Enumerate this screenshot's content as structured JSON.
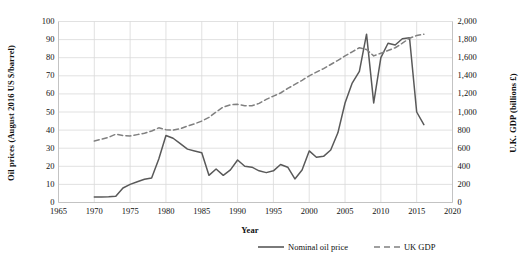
{
  "chart_data": {
    "type": "line",
    "title": "",
    "xlabel": "Year",
    "ylabel_left": "Oil prices (August 2016 US $/barrel)",
    "ylabel_right": "U.K. GDP (billions £)",
    "xlim": [
      1965,
      2020
    ],
    "ylim_left": [
      0,
      100
    ],
    "ylim_right": [
      0,
      2000
    ],
    "xticks": [
      "1965",
      "1970",
      "1975",
      "1980",
      "1985",
      "1990",
      "1995",
      "2000",
      "2005",
      "2010",
      "2015",
      "2020"
    ],
    "yticks_left": [
      "0",
      "10",
      "20",
      "30",
      "40",
      "50",
      "60",
      "70",
      "80",
      "90",
      "100"
    ],
    "yticks_right": [
      "0",
      "200",
      "400",
      "600",
      "800",
      "1,000",
      "1,200",
      "1,400",
      "1,600",
      "1,800",
      "2,000"
    ],
    "grid": true,
    "legend_position": "bottom",
    "colors": {
      "oil": "#595959",
      "gdp": "#808080",
      "grid": "#d9d9d9",
      "axis": "#bfbfbf"
    },
    "series": [
      {
        "name": "Nominal oil price",
        "axis": "left",
        "style": "solid",
        "x": [
          1970,
          1971,
          1972,
          1973,
          1974,
          1975,
          1976,
          1977,
          1978,
          1979,
          1980,
          1981,
          1982,
          1983,
          1984,
          1985,
          1986,
          1987,
          1988,
          1989,
          1990,
          1991,
          1992,
          1993,
          1994,
          1995,
          1996,
          1997,
          1998,
          1999,
          2000,
          2001,
          2002,
          2003,
          2004,
          2005,
          2006,
          2007,
          2008,
          2009,
          2010,
          2011,
          2012,
          2013,
          2014,
          2015,
          2016
        ],
        "values": [
          3.0,
          3.1,
          3.2,
          3.4,
          8.0,
          10.0,
          11.5,
          12.8,
          13.5,
          24.0,
          37.0,
          35.5,
          32.5,
          29.5,
          28.5,
          27.5,
          15.0,
          18.5,
          15.0,
          18.0,
          23.5,
          20.0,
          19.5,
          17.5,
          16.5,
          17.5,
          21.0,
          19.5,
          13.0,
          18.0,
          28.5,
          25.0,
          25.5,
          29.0,
          38.5,
          55.0,
          66.0,
          72.5,
          93.0,
          55.0,
          80.0,
          88.0,
          87.0,
          90.5,
          91.0,
          50.0,
          43.0
        ]
      },
      {
        "name": "UK GDP",
        "axis": "right",
        "style": "dashed",
        "x": [
          1970,
          1971,
          1972,
          1973,
          1974,
          1975,
          1976,
          1977,
          1978,
          1979,
          1980,
          1981,
          1982,
          1983,
          1984,
          1985,
          1986,
          1987,
          1988,
          1989,
          1990,
          1991,
          1992,
          1993,
          1994,
          1995,
          1996,
          1997,
          1998,
          1999,
          2000,
          2001,
          2002,
          2003,
          2004,
          2005,
          2006,
          2007,
          2008,
          2009,
          2010,
          2011,
          2012,
          2013,
          2014,
          2015,
          2016
        ],
        "values": [
          680,
          700,
          720,
          755,
          740,
          735,
          750,
          765,
          790,
          825,
          805,
          800,
          815,
          845,
          870,
          900,
          940,
          1000,
          1055,
          1080,
          1085,
          1070,
          1070,
          1095,
          1140,
          1175,
          1210,
          1260,
          1305,
          1350,
          1400,
          1440,
          1480,
          1525,
          1570,
          1620,
          1665,
          1710,
          1690,
          1620,
          1650,
          1680,
          1710,
          1760,
          1815,
          1845,
          1860
        ]
      }
    ]
  },
  "legend": {
    "items": [
      {
        "label": "Nominal oil price",
        "style": "solid"
      },
      {
        "label": "UK GDP",
        "style": "dashed"
      }
    ]
  }
}
